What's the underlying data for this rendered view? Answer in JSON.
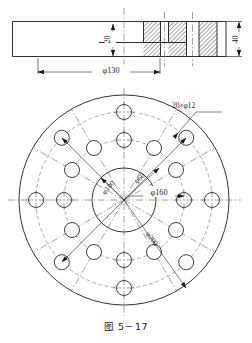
{
  "figure": {
    "caption": "图 5－17",
    "line_color": "#1a1a1a",
    "center_line_color": "#555555",
    "background": "#ffffff"
  },
  "section_view": {
    "name": "front-sectional-view",
    "dimensions": [
      {
        "id": "dia130",
        "label": "φ130",
        "value": 130,
        "orientation": "horizontal"
      },
      {
        "id": "h20",
        "label": "20",
        "value": 20,
        "orientation": "vertical"
      },
      {
        "id": "h40",
        "label": "40",
        "value": 40,
        "orientation": "vertical"
      }
    ],
    "hatched_regions": 3
  },
  "plan_view": {
    "name": "plan-circular-view",
    "callout": {
      "label": "20×φ12",
      "count": 20,
      "hole_diameter": 12
    },
    "circles": [
      {
        "id": "bolt-circle-60",
        "label": "φ60",
        "value": 60,
        "kind": "center"
      },
      {
        "id": "bore-100",
        "label": "φ100",
        "value": 100,
        "kind": "solid"
      },
      {
        "id": "bolt-circle-160",
        "label": "φ160",
        "value": 160,
        "kind": "center"
      },
      {
        "id": "outer-200",
        "label": "φ200",
        "value": 200,
        "kind": "solid"
      }
    ],
    "hole_rings": [
      {
        "diameter": 160,
        "count": 12
      },
      {
        "diameter": 200,
        "count": 8
      }
    ]
  }
}
